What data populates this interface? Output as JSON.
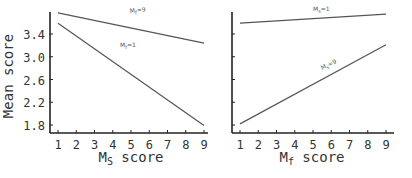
{
  "chart_data": [
    {
      "type": "line",
      "panel": "left",
      "xlabel": "Ms score",
      "xlabel_main": "M",
      "xlabel_sub": "S",
      "xlabel_rest": " score",
      "ylabel": "Mean score",
      "x_ticks": [
        "1",
        "2",
        "3",
        "4",
        "5",
        "6",
        "7",
        "8",
        "9"
      ],
      "y_ticks": [
        "3.4",
        "3.0",
        "2.6",
        "2.2",
        "1.8"
      ],
      "ylim": [
        1.75,
        3.8
      ],
      "xlim": [
        0.5,
        9.2
      ],
      "grid": false,
      "series": [
        {
          "name": "Mf=9",
          "label_main": "M",
          "label_sub": "f",
          "label_rest": "=9",
          "x": [
            1,
            9
          ],
          "values": [
            3.77,
            3.24
          ]
        },
        {
          "name": "Mf=1",
          "label_main": "M",
          "label_sub": "f",
          "label_rest": "=1",
          "x": [
            1,
            9
          ],
          "values": [
            3.59,
            1.79
          ]
        }
      ]
    },
    {
      "type": "line",
      "panel": "right",
      "xlabel": "Mf score",
      "xlabel_main": "M",
      "xlabel_sub": "f",
      "xlabel_rest": " score",
      "ylabel": "",
      "x_ticks": [
        "1",
        "2",
        "3",
        "4",
        "5",
        "6",
        "7",
        "8",
        "9"
      ],
      "y_ticks": [],
      "ylim": [
        1.75,
        3.8
      ],
      "xlim": [
        0.5,
        9.2
      ],
      "grid": false,
      "series": [
        {
          "name": "Ms=1",
          "label_main": "M",
          "label_sub": "s",
          "label_rest": "=1",
          "x": [
            1,
            9
          ],
          "values": [
            3.59,
            3.75
          ]
        },
        {
          "name": "Ms=9",
          "label_main": "M",
          "label_sub": "s",
          "label_rest": "=9",
          "x": [
            1,
            9
          ],
          "values": [
            1.82,
            3.21
          ]
        }
      ]
    }
  ],
  "colors": {
    "line": "#555555",
    "axis": "#222222",
    "text": "#333333"
  }
}
